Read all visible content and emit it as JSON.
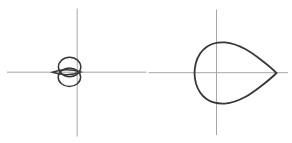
{
  "page": {
    "background": "#ffffff"
  },
  "colors": {
    "axis": "#a6a6a6",
    "curve": "#383838"
  },
  "chart_data": [
    {
      "type": "line",
      "name": "small-loop-curve-plot",
      "title": "",
      "xlabel": "",
      "ylabel": "",
      "grid": false,
      "tick_labels": false,
      "legend": false,
      "description": "Small closed curve left of the origin: two overlapping near-circular loops stacked vertically plus a thin horizontal lens-shaped tail ending in a sharp point at the far left; the right edge of the loops just crosses the vertical axis",
      "axes": {
        "h": {
          "kind": "line",
          "x1": 7,
          "y1": 72.2,
          "x2": 146.5,
          "y2": 72.2,
          "stroke": "#a6a6a6",
          "stroke_width": 1
        },
        "v": {
          "kind": "line",
          "x1": 77.2,
          "y1": 8.5,
          "x2": 77.2,
          "y2": 136.5,
          "stroke": "#a6a6a6",
          "stroke_width": 1
        }
      },
      "shapes": {
        "upper_loop": {
          "kind": "ellipse",
          "cx": 69.6,
          "cy": 67.0,
          "rx": 11.2,
          "ry": 9.8,
          "stroke": "#383838",
          "stroke_width": 1.5
        },
        "lower_loop": {
          "kind": "ellipse",
          "cx": 69.4,
          "cy": 77.2,
          "rx": 11.2,
          "ry": 9.3,
          "stroke": "#383838",
          "stroke_width": 1.5
        },
        "lens_tail": {
          "kind": "path",
          "d": "M 52.4 72.2 Q 66.5 67.4 80.7 72.0 Q 66.5 77.2 52.4 72.2 Z",
          "stroke": "#383838",
          "stroke_width": 1.5
        }
      }
    },
    {
      "type": "line",
      "name": "teardrop-curve-plot",
      "title": "",
      "xlabel": "",
      "ylabel": "",
      "grid": false,
      "tick_labels": false,
      "legend": false,
      "description": "Teardrop curve (x = cos t, y = sin t sin(t/2)): large closed curve, rounded on the left extending past the vertical axis, tapering to a sharp ~90-degree point on the right at the end of the horizontal axis",
      "equation": "x = cos(t), y = sin(t)*sin(t/2)",
      "extent_px": {
        "left": 194.5,
        "right_tip": 276.5,
        "top": 42.4,
        "bottom": 103.6
      },
      "axes": {
        "h": {
          "kind": "line",
          "x1": 148.5,
          "y1": 72.7,
          "x2": 288,
          "y2": 72.7,
          "stroke": "#a6a6a6",
          "stroke_width": 1
        },
        "v": {
          "kind": "line",
          "x1": 216.5,
          "y1": 9.5,
          "x2": 216.5,
          "y2": 135,
          "stroke": "#a6a6a6",
          "stroke_width": 1
        }
      },
      "shapes": {
        "outline": {
          "kind": "path",
          "d": "M 276.5 73 C 269.0 65.5 252.6 53.0 246.1 49.5 C 239.6 46.0 231.7 42.9 224.9 42.4 C 218.1 42.1 211.5 43.3 206.5 46.9 C 201.5 50.5 197.5 57.1 195.9 62.7 C 194.6 68.3 194.5 69.7 194.5 73 C 194.5 76.3 194.6 77.7 195.9 83.3 C 197.5 88.9 201.5 95.5 206.5 99.1 C 211.5 102.7 218.1 103.9 224.9 103.6 C 231.7 103.1 239.6 100.0 246.1 96.5 C 252.6 93.0 269.0 80.5 276.5 73 Z",
          "stroke": "#383838",
          "stroke_width": 1.8
        }
      }
    }
  ]
}
